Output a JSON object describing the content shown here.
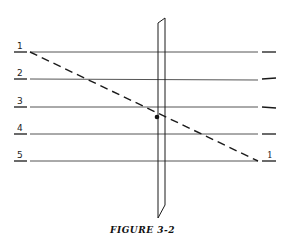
{
  "figure": {
    "caption": "FIGURE 3-2",
    "left_labels": [
      "1",
      "2",
      "3",
      "4",
      "5"
    ],
    "right_labels": [
      "",
      "",
      "",
      "",
      "1"
    ],
    "line_y": [
      52,
      79,
      107,
      134,
      161
    ],
    "line_x_start": 30,
    "line_x_end": 258,
    "dashed_line": {
      "from_label": "1",
      "to_label": "1",
      "x1": 30,
      "y1": 52,
      "x2": 258,
      "y2": 161
    },
    "intersection_dot": {
      "x": 157,
      "y": 117
    },
    "colors": {
      "ink": "#1a1a1a",
      "line": "#555555",
      "background": "#ffffff"
    }
  }
}
